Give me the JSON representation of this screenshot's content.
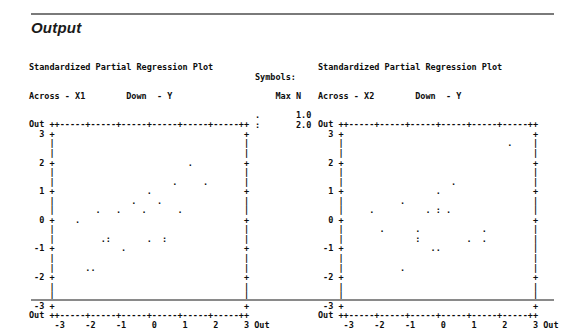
{
  "section": {
    "title": "Output"
  },
  "legend": {
    "heading": "Symbols:",
    "column_header": "Max N",
    "rows": [
      {
        "symbol": ".",
        "value": "1.0"
      },
      {
        "symbol": ":",
        "value": "2.0"
      }
    ],
    "text": "Symbols:\n\n    Max N\n\n.       1.0\n:       2.0"
  },
  "plots": [
    {
      "id": "plot-x1",
      "title": "Standardized Partial Regression Plot",
      "across_label": "Across - X1",
      "down_label": "Down  - Y",
      "subhead": "Across - X1        Down  - Y",
      "axis": {
        "x_ticks": [
          "-3",
          "-2",
          "-1",
          "0",
          "1",
          "2",
          "3"
        ],
        "x_out_left": "Out",
        "x_out_right": "Out",
        "y_ticks": [
          "3",
          "2",
          "1",
          "0",
          "-1",
          "-2",
          "-3"
        ],
        "y_out_top": "Out",
        "y_out_bottom": "Out",
        "xlim": [
          -3,
          3
        ],
        "ylim": [
          -3,
          3
        ],
        "ruler": "++-----+-----+-----+-----+-----+-----++"
      },
      "grid": "Out ++-----+-----+-----+-----+-----+-----++\n  3 +                                     +\n    |                                     |\n    |                                     |\n  2 +                          .          +\n    |                                     |\n    |                       .     .       |\n  1 +                  .                  +\n    |               .    .                |\n    |        .   .    .      .            |\n  0 +    .                                +\n    |                                     |\n    |         .:       .  :               |\n -1 +             .                       +\n    |                                     |\n    |      ..                             |\n -2 +                                     +\n    |                                     |\n    |                                     |\n -3 +                                     +\nOut ++-----+-----+-----+-----+-----+-----++\n     -3    -2    -1     0     1     2     3 Out"
    },
    {
      "id": "plot-x2",
      "title": "Standardized Partial Regression Plot",
      "across_label": "Across - X2",
      "down_label": "Down  - Y",
      "subhead": "Across - X2        Down  - Y",
      "axis": {
        "x_ticks": [
          "-3",
          "-2",
          "-1",
          "0",
          "1",
          "2",
          "3"
        ],
        "x_out_left": "Out",
        "x_out_right": "Out",
        "y_ticks": [
          "3",
          "2",
          "1",
          "0",
          "-1",
          "-2",
          "-3"
        ],
        "y_out_top": "Out",
        "y_out_bottom": "Out",
        "xlim": [
          -3,
          3
        ],
        "ylim": [
          -3,
          3
        ],
        "ruler": "++-----+-----+-----+-----+-----+-----++"
      },
      "grid": "Out ++-----+-----+-----+-----+-----+-----++\n  3 +                                     +\n    |                                .    |\n    |                                     |\n  2 +                                     +\n    |                                     |\n    |                     .               |\n  1 +                  .                  +\n    |           .                         |\n    |     .          . : .                |\n  0 +                                     +\n    |       .      .            .         |\n    |              :         .  .         |\n -1 +                 ..                  |\n    |                                     |\n    |           .                         |\n -2 +                                     +\n    |                                     |\n    |                                     |\n -3 +                                     +\nOut ++-----+-----+-----+-----+-----+-----++\n     -3    -2    -1     0     1     2     3 Out"
    }
  ],
  "chart_data": [
    {
      "type": "scatter",
      "id": "plot-x1",
      "title": "Standardized Partial Regression Plot",
      "xlabel": "Across - X1",
      "ylabel": "Down - Y",
      "xlim": [
        -3,
        3
      ],
      "ylim": [
        -3,
        3
      ],
      "xticks": [
        -3,
        -2,
        -1,
        0,
        1,
        2,
        3
      ],
      "yticks": [
        -3,
        -2,
        -1,
        0,
        1,
        2,
        3
      ],
      "grid": false,
      "legend": "Symbols: Max N, '.' = 1.0, ':' = 2.0",
      "points": [
        {
          "x": 1.0,
          "y": 2.0,
          "symbol": ".",
          "n": 1
        },
        {
          "x": 0.5,
          "y": 1.65,
          "symbol": ".",
          "n": 1
        },
        {
          "x": 1.4,
          "y": 1.65,
          "symbol": ".",
          "n": 1
        },
        {
          "x": 0.0,
          "y": 1.0,
          "symbol": ".",
          "n": 1
        },
        {
          "x": -0.4,
          "y": 0.65,
          "symbol": ".",
          "n": 1
        },
        {
          "x": 0.2,
          "y": 0.65,
          "symbol": ".",
          "n": 1
        },
        {
          "x": -1.4,
          "y": 0.35,
          "symbol": ".",
          "n": 1
        },
        {
          "x": -0.9,
          "y": 0.35,
          "symbol": ".",
          "n": 1
        },
        {
          "x": -0.4,
          "y": 0.35,
          "symbol": ".",
          "n": 1
        },
        {
          "x": 0.4,
          "y": 0.35,
          "symbol": ".",
          "n": 1
        },
        {
          "x": -2.0,
          "y": 0.0,
          "symbol": ".",
          "n": 1
        },
        {
          "x": -1.2,
          "y": -0.65,
          "symbol": ".",
          "n": 1
        },
        {
          "x": -1.0,
          "y": -0.65,
          "symbol": ":",
          "n": 2
        },
        {
          "x": -0.2,
          "y": -0.65,
          "symbol": ".",
          "n": 1
        },
        {
          "x": 0.2,
          "y": -0.65,
          "symbol": ":",
          "n": 2
        },
        {
          "x": -0.6,
          "y": -1.0,
          "symbol": ".",
          "n": 1
        },
        {
          "x": -1.5,
          "y": -1.6,
          "symbol": ".",
          "n": 1
        },
        {
          "x": -1.3,
          "y": -1.6,
          "symbol": ".",
          "n": 1
        }
      ]
    },
    {
      "type": "scatter",
      "id": "plot-x2",
      "title": "Standardized Partial Regression Plot",
      "xlabel": "Across - X2",
      "ylabel": "Down - Y",
      "xlim": [
        -3,
        3
      ],
      "ylim": [
        -3,
        3
      ],
      "xticks": [
        -3,
        -2,
        -1,
        0,
        1,
        2,
        3
      ],
      "yticks": [
        -3,
        -2,
        -1,
        0,
        1,
        2,
        3
      ],
      "grid": false,
      "legend": "Symbols: Max N, '.' = 1.0, ':' = 2.0",
      "points": [
        {
          "x": 2.3,
          "y": 2.65,
          "symbol": ".",
          "n": 1
        },
        {
          "x": 0.7,
          "y": 1.35,
          "symbol": ".",
          "n": 1
        },
        {
          "x": 0.2,
          "y": 1.0,
          "symbol": ".",
          "n": 1
        },
        {
          "x": -1.0,
          "y": 0.65,
          "symbol": ".",
          "n": 1
        },
        {
          "x": -1.9,
          "y": 0.35,
          "symbol": ".",
          "n": 1
        },
        {
          "x": -0.2,
          "y": 0.35,
          "symbol": ".",
          "n": 1
        },
        {
          "x": 0.1,
          "y": 0.35,
          "symbol": ":",
          "n": 2
        },
        {
          "x": 0.5,
          "y": 0.35,
          "symbol": ".",
          "n": 1
        },
        {
          "x": -1.6,
          "y": -0.35,
          "symbol": ".",
          "n": 1
        },
        {
          "x": -0.7,
          "y": -0.35,
          "symbol": ".",
          "n": 1
        },
        {
          "x": 1.0,
          "y": -0.35,
          "symbol": ".",
          "n": 1
        },
        {
          "x": -0.7,
          "y": -0.65,
          "symbol": ":",
          "n": 2
        },
        {
          "x": 0.6,
          "y": -0.65,
          "symbol": ".",
          "n": 1
        },
        {
          "x": 1.0,
          "y": -0.65,
          "symbol": ".",
          "n": 1
        },
        {
          "x": -0.3,
          "y": -1.0,
          "symbol": ".",
          "n": 1
        },
        {
          "x": -0.1,
          "y": -1.0,
          "symbol": ".",
          "n": 1
        },
        {
          "x": -1.0,
          "y": -1.6,
          "symbol": ".",
          "n": 1
        }
      ]
    }
  ]
}
